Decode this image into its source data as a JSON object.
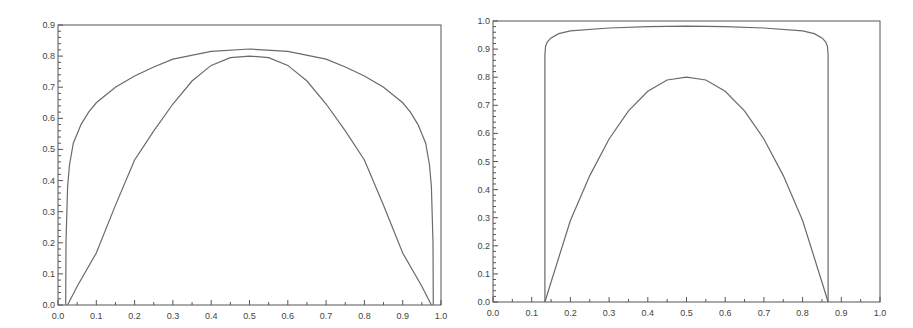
{
  "chart_data": [
    {
      "type": "line",
      "title": "",
      "xlabel": "",
      "ylabel": "",
      "xlim": [
        0.0,
        1.0
      ],
      "ylim": [
        0.0,
        0.9
      ],
      "grid": false,
      "legend": null,
      "x_ticks": [
        "0.0",
        "0.1",
        "0.2",
        "0.3",
        "0.4",
        "0.5",
        "0.6",
        "0.7",
        "0.8",
        "0.9",
        "1.0"
      ],
      "y_ticks": [
        "0.0",
        "0.1",
        "0.2",
        "0.3",
        "0.4",
        "0.5",
        "0.6",
        "0.7",
        "0.8",
        "0.9"
      ],
      "series": [
        {
          "name": "outer",
          "x": [
            0.02,
            0.021,
            0.025,
            0.03,
            0.04,
            0.06,
            0.08,
            0.1,
            0.15,
            0.2,
            0.25,
            0.3,
            0.4,
            0.5,
            0.6,
            0.7,
            0.75,
            0.8,
            0.85,
            0.9,
            0.92,
            0.94,
            0.96,
            0.97,
            0.975,
            0.979,
            0.98
          ],
          "y": [
            0.0,
            0.2,
            0.38,
            0.45,
            0.52,
            0.58,
            0.62,
            0.65,
            0.7,
            0.736,
            0.765,
            0.79,
            0.815,
            0.823,
            0.815,
            0.79,
            0.765,
            0.736,
            0.7,
            0.65,
            0.62,
            0.58,
            0.52,
            0.45,
            0.38,
            0.2,
            0.0
          ]
        },
        {
          "name": "inner",
          "x": [
            0.025,
            0.05,
            0.1,
            0.15,
            0.2,
            0.25,
            0.3,
            0.35,
            0.4,
            0.45,
            0.5,
            0.55,
            0.6,
            0.65,
            0.7,
            0.75,
            0.8,
            0.85,
            0.9,
            0.95,
            0.975
          ],
          "y": [
            0.0,
            0.06,
            0.167,
            0.32,
            0.466,
            0.56,
            0.646,
            0.72,
            0.77,
            0.795,
            0.8,
            0.795,
            0.77,
            0.72,
            0.646,
            0.56,
            0.466,
            0.32,
            0.167,
            0.06,
            0.0
          ]
        }
      ]
    },
    {
      "type": "line",
      "title": "",
      "xlabel": "",
      "ylabel": "",
      "xlim": [
        0.0,
        1.0
      ],
      "ylim": [
        0.0,
        1.0
      ],
      "grid": false,
      "legend": null,
      "x_ticks": [
        "0.0",
        "0.1",
        "0.2",
        "0.3",
        "0.4",
        "0.5",
        "0.6",
        "0.7",
        "0.8",
        "0.9",
        "1.0"
      ],
      "y_ticks": [
        "0.0",
        "0.1",
        "0.2",
        "0.3",
        "0.4",
        "0.5",
        "0.6",
        "0.7",
        "0.8",
        "0.9",
        "1.0"
      ],
      "series": [
        {
          "name": "outer",
          "x": [
            0.134,
            0.134,
            0.136,
            0.14,
            0.15,
            0.17,
            0.2,
            0.3,
            0.4,
            0.5,
            0.6,
            0.7,
            0.8,
            0.83,
            0.85,
            0.86,
            0.864,
            0.866,
            0.866
          ],
          "y": [
            0.0,
            0.88,
            0.91,
            0.925,
            0.94,
            0.955,
            0.965,
            0.975,
            0.98,
            0.982,
            0.98,
            0.975,
            0.965,
            0.955,
            0.94,
            0.925,
            0.91,
            0.88,
            0.0
          ]
        },
        {
          "name": "inner",
          "x": [
            0.134,
            0.15,
            0.2,
            0.25,
            0.3,
            0.35,
            0.4,
            0.45,
            0.5,
            0.55,
            0.6,
            0.65,
            0.7,
            0.75,
            0.8,
            0.85,
            0.866
          ],
          "y": [
            0.0,
            0.07,
            0.29,
            0.45,
            0.58,
            0.68,
            0.75,
            0.79,
            0.8,
            0.79,
            0.75,
            0.68,
            0.58,
            0.45,
            0.29,
            0.07,
            0.0
          ]
        }
      ]
    }
  ],
  "layout": {
    "plots": [
      {
        "left": 58,
        "right": 441,
        "top": 25,
        "bottom": 305
      },
      {
        "left": 493,
        "right": 880,
        "top": 21,
        "bottom": 302
      }
    ]
  }
}
